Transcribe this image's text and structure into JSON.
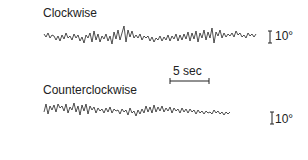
{
  "figure": {
    "traces": [
      {
        "label": "Clockwise",
        "scale_label": "10°"
      },
      {
        "label": "Counterclockwise",
        "scale_label": "10°"
      }
    ],
    "time_scale_label": "5 sec",
    "ink_color": "#222222"
  }
}
